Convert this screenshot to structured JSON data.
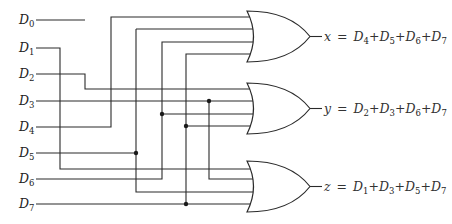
{
  "diagram": {
    "inputs": [
      {
        "name": "D",
        "sub": "0",
        "y": 20
      },
      {
        "name": "D",
        "sub": "1",
        "y": 48
      },
      {
        "name": "D",
        "sub": "2",
        "y": 74
      },
      {
        "name": "D",
        "sub": "3",
        "y": 101
      },
      {
        "name": "D",
        "sub": "4",
        "y": 127
      },
      {
        "name": "D",
        "sub": "5",
        "y": 153
      },
      {
        "name": "D",
        "sub": "6",
        "y": 179
      },
      {
        "name": "D",
        "sub": "7",
        "y": 204
      }
    ],
    "gates": [
      {
        "type": "OR",
        "output": "x",
        "terms": [
          "4",
          "5",
          "6",
          "7"
        ]
      },
      {
        "type": "OR",
        "output": "y",
        "terms": [
          "2",
          "3",
          "6",
          "7"
        ]
      },
      {
        "type": "OR",
        "output": "z",
        "terms": [
          "1",
          "3",
          "5",
          "7"
        ]
      }
    ],
    "equations": {
      "x": {
        "lhs": "x",
        "eq": "=",
        "plus": "+",
        "var": "D",
        "subs": [
          "4",
          "5",
          "6",
          "7"
        ]
      },
      "y": {
        "lhs": "y",
        "eq": "=",
        "plus": "+",
        "var": "D",
        "subs": [
          "2",
          "3",
          "6",
          "7"
        ]
      },
      "z": {
        "lhs": "z",
        "eq": "=",
        "plus": "+",
        "var": "D",
        "subs": [
          "1",
          "3",
          "5",
          "7"
        ]
      }
    },
    "colors": {
      "line": "#2a2a2a",
      "background": "#ffffff",
      "text": "#222222"
    }
  }
}
